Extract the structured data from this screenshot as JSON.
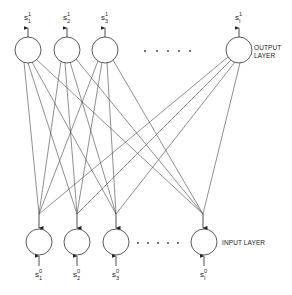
{
  "diagram": {
    "type": "neural-network",
    "output_layer": {
      "label_line1": "OUTPUT",
      "label_line2": "LAYER",
      "nodes": [
        {
          "id": "out-1",
          "symbol": "s",
          "sub": "1",
          "sup": "1"
        },
        {
          "id": "out-2",
          "symbol": "s",
          "sub": "2",
          "sup": "1"
        },
        {
          "id": "out-3",
          "symbol": "s",
          "sub": "3",
          "sup": "1"
        },
        {
          "id": "out-I",
          "symbol": "s",
          "sub": "I",
          "sup": "1"
        }
      ],
      "ellipsis": "• • • • •"
    },
    "input_layer": {
      "label": "INPUT LAYER",
      "nodes": [
        {
          "id": "in-1",
          "symbol": "s",
          "sub": "1",
          "sup": "0"
        },
        {
          "id": "in-2",
          "symbol": "s",
          "sub": "2",
          "sup": "0"
        },
        {
          "id": "in-3",
          "symbol": "s",
          "sub": "3",
          "sup": "0"
        },
        {
          "id": "in-I",
          "symbol": "s",
          "sub": "I",
          "sup": "0"
        }
      ],
      "ellipsis": "• • • • •"
    },
    "connections": "fully-connected (every output node to every input node)",
    "colors": {
      "stroke": "#333333",
      "background": "#ffffff"
    }
  }
}
